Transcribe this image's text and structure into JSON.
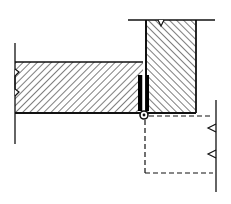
{
  "diagram": {
    "type": "architectural section",
    "elements": [
      {
        "id": "door-leaf",
        "kind": "hatched-section",
        "shape": "rectangle",
        "description": "Door leaf (hatched, with break symbol at left)"
      },
      {
        "id": "jamb",
        "kind": "hatched-section",
        "shape": "rectangle",
        "description": "Jamb / frame (hatched, with break symbol at top)"
      },
      {
        "id": "hinge-leaf",
        "kind": "solid-fill",
        "description": "Hinge leaf plates (black)"
      },
      {
        "id": "hinge-pin",
        "kind": "circle",
        "description": "Hinge knuckle / pin pivot"
      },
      {
        "id": "open-position",
        "kind": "dashed-outline",
        "description": "Door swung open position (dashed)"
      }
    ]
  },
  "colors": {
    "line": "#111111",
    "background": "#ffffff",
    "hinge_fill": "#000000"
  }
}
